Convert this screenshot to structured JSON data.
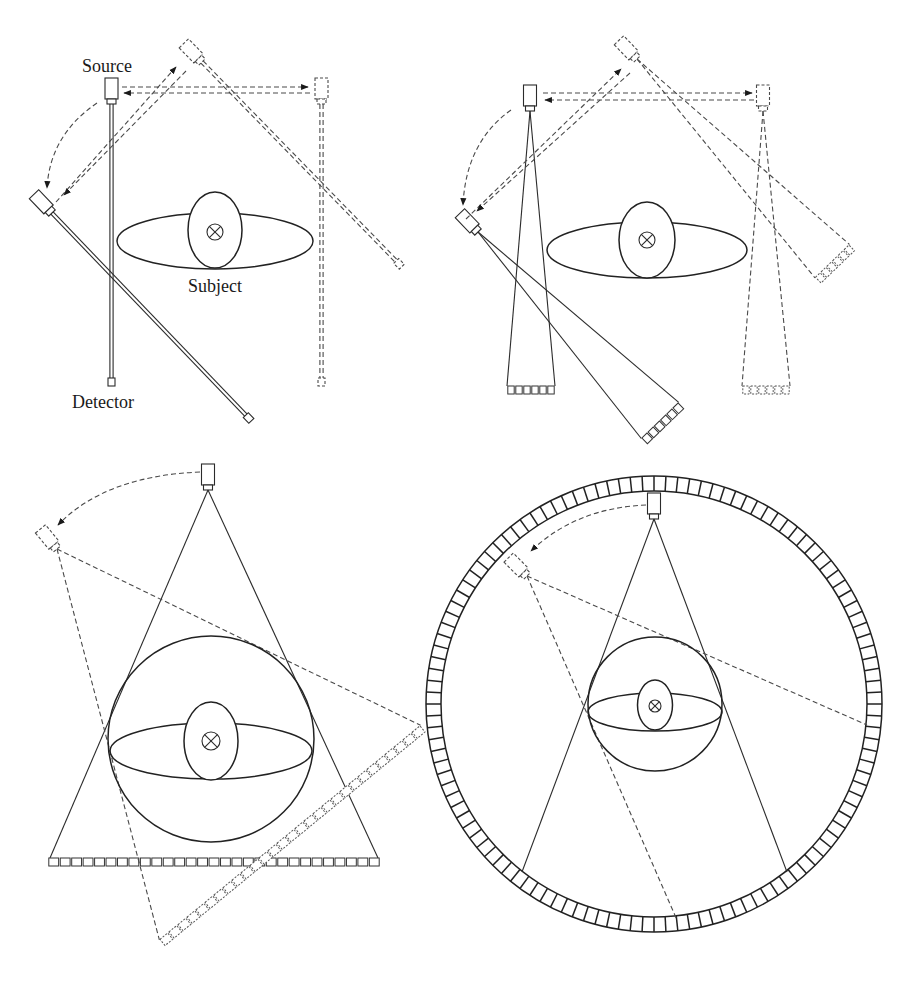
{
  "labels": {
    "source": "Source",
    "subject": "Subject",
    "detector": "Detector"
  },
  "panels": [
    {
      "id": "a",
      "description": "First generation: pencil beam, translate-rotate"
    },
    {
      "id": "b",
      "description": "Second generation: narrow fan beam, translate-rotate"
    },
    {
      "id": "c",
      "description": "Third generation: wide fan beam, rotate-rotate"
    },
    {
      "id": "d",
      "description": "Fourth generation: rotating source, stationary ring detector"
    }
  ],
  "symbols": {
    "axis_marker": "⊗"
  },
  "diagram": {
    "rows": {
      "b_main": {
        "x": 507,
        "y": 386,
        "w": 48,
        "h": 8,
        "n": 6,
        "dashed": false
      },
      "b_dashed": {
        "x": 742,
        "y": 386,
        "w": 48,
        "h": 8,
        "n": 6,
        "dashed": true
      },
      "b_top_rot": {
        "x": -24,
        "y": 281,
        "w": 48,
        "h": 8,
        "n": 6,
        "dashed": true
      },
      "b_left_rot": {
        "x": -26,
        "y": 262,
        "w": 52,
        "h": 8,
        "n": 6,
        "dashed": false
      },
      "c_main": {
        "x": 48,
        "y": 858,
        "w": 332,
        "h": 8,
        "n": 29,
        "dashed": false
      },
      "c_rot": {
        "x": -169,
        "y": 367,
        "w": 338,
        "h": 8,
        "n": 29,
        "dashed": true
      }
    },
    "ring": {
      "cx": 654,
      "cy": 704,
      "r_inner": 213,
      "r_outer": 228,
      "cells": 120
    }
  }
}
